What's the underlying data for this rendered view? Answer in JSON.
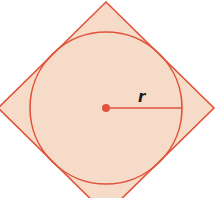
{
  "diagram": {
    "radius_label": "r",
    "colors": {
      "stroke": "#e0533a",
      "fill": "#f6dcc8",
      "center_dot": "#e0533a",
      "background": "#ffffff"
    }
  }
}
